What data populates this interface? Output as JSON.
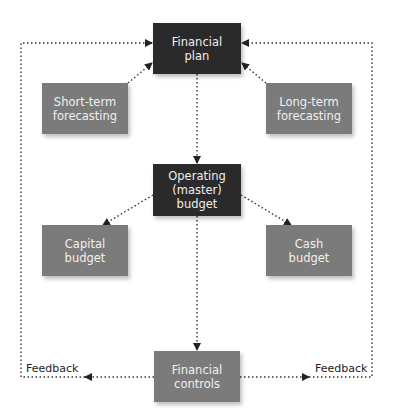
{
  "diagram": {
    "nodes": {
      "financial_plan": {
        "label": "Financial\nplan",
        "style": "dark"
      },
      "short_term": {
        "label": "Short-term\nforecasting",
        "style": "grey"
      },
      "long_term": {
        "label": "Long-term\nforecasting",
        "style": "grey"
      },
      "operating_budget": {
        "label": "Operating\n(master)\nbudget",
        "style": "dark"
      },
      "capital_budget": {
        "label": "Capital\nbudget",
        "style": "grey"
      },
      "cash_budget": {
        "label": "Cash\nbudget",
        "style": "grey"
      },
      "financial_controls": {
        "label": "Financial\ncontrols",
        "style": "grey"
      }
    },
    "edges": [
      {
        "from": "short_term",
        "to": "financial_plan"
      },
      {
        "from": "long_term",
        "to": "financial_plan"
      },
      {
        "from": "financial_plan",
        "to": "operating_budget"
      },
      {
        "from": "operating_budget",
        "to": "capital_budget"
      },
      {
        "from": "operating_budget",
        "to": "cash_budget"
      },
      {
        "from": "operating_budget",
        "to": "financial_controls"
      },
      {
        "from": "financial_controls",
        "to": "financial_plan",
        "label": "Feedback",
        "side": "left"
      },
      {
        "from": "financial_controls",
        "to": "financial_plan",
        "label": "Feedback",
        "side": "right"
      }
    ],
    "feedback_left_label": "Feedback",
    "feedback_right_label": "Feedback",
    "colors": {
      "dark": "#2a2a2a",
      "grey": "#7b7b7b",
      "line": "#333333"
    }
  }
}
